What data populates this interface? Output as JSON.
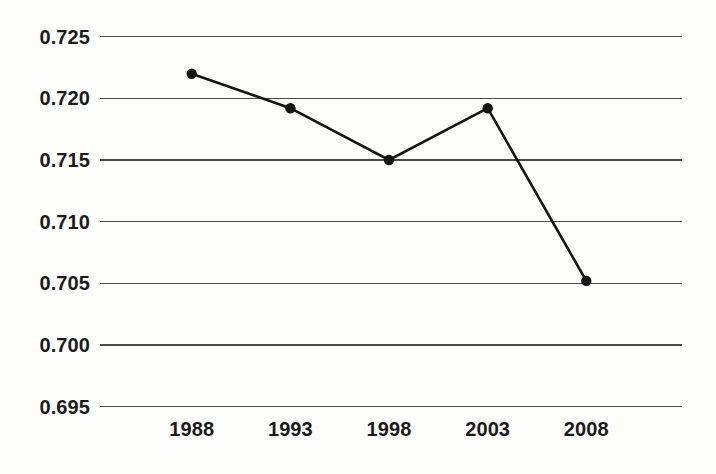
{
  "chart_data": {
    "type": "line",
    "title": "",
    "subtitle": "",
    "xlabel": "",
    "ylabel": "",
    "categories": [
      "1988",
      "1993",
      "1998",
      "2003",
      "2008"
    ],
    "x": [
      1988,
      1993,
      1998,
      2003,
      2008
    ],
    "values": [
      0.722,
      0.7192,
      0.715,
      0.7192,
      0.7052
    ],
    "series": [
      {
        "name": "",
        "values": [
          0.722,
          0.7192,
          0.715,
          0.7192,
          0.7052
        ]
      }
    ],
    "ylim": [
      0.695,
      0.725
    ],
    "xlim": [
      1988,
      2008
    ],
    "yticks": [
      0.695,
      0.7,
      0.705,
      0.71,
      0.715,
      0.72,
      0.725
    ],
    "ytick_labels": [
      "0.695",
      "0.700",
      "0.705",
      "0.710",
      "0.715",
      "0.720",
      "0.725"
    ],
    "xticks": [
      1988,
      1993,
      1998,
      2003,
      2008
    ],
    "xtick_labels": [
      "1988",
      "1993",
      "1998",
      "2003",
      "2008"
    ],
    "grid": "horizontal",
    "legend": "none",
    "marker": "filled-circle",
    "line_color": "#141414",
    "marker_color": "#141414",
    "grid_color": "#4a4a4a",
    "background_color": "#fdfdfc",
    "annotations": []
  }
}
